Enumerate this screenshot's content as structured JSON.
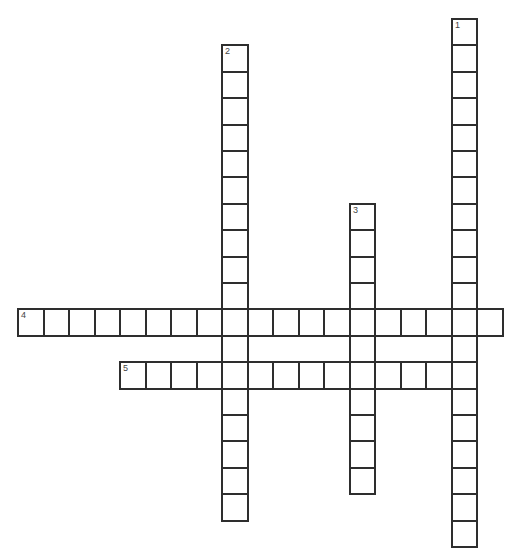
{
  "puzzle": {
    "grid": {
      "origin_x": 17,
      "origin_y": 18,
      "cell_width": 25.5,
      "cell_height": 26.4,
      "border_color": "#2e2e2e",
      "number_color": "#444444"
    },
    "entries": [
      {
        "number": "1",
        "direction": "down",
        "row": 0,
        "col": 17,
        "length": 20
      },
      {
        "number": "2",
        "direction": "down",
        "row": 1,
        "col": 8,
        "length": 18
      },
      {
        "number": "3",
        "direction": "down",
        "row": 7,
        "col": 13,
        "length": 11
      },
      {
        "number": "4",
        "direction": "across",
        "row": 11,
        "col": 0,
        "length": 19
      },
      {
        "number": "5",
        "direction": "across",
        "row": 13,
        "col": 4,
        "length": 14
      }
    ]
  }
}
